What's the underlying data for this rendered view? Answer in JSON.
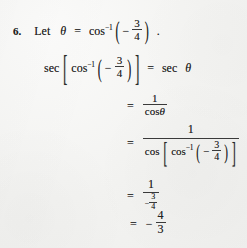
{
  "document": {
    "type": "math-solution",
    "problem_number": "6.",
    "background_color": "#f2f2f0",
    "ink_color": "#232323"
  },
  "line1": {
    "lead": "Let",
    "theta": "θ",
    "equals": "=",
    "fn": "cos",
    "exp": "−1",
    "open_paren": "(",
    "minus": "−",
    "numerator": "3",
    "denominator": "4",
    "close_paren": ")",
    "period": "."
  },
  "line2": {
    "sec": "sec",
    "open_bracket": "[",
    "fn": "cos",
    "exp": "−1",
    "open_paren": "(",
    "minus": "−",
    "numerator": "3",
    "denominator": "4",
    "close_paren": ")",
    "close_bracket": "]",
    "equals": "=",
    "rhs_fn": "sec",
    "rhs_theta": "θ"
  },
  "line3": {
    "equals": "=",
    "numerator": "1",
    "denominator_fn": "cos",
    "denominator_theta": "θ"
  },
  "line4": {
    "equals": "=",
    "numerator": "1",
    "den_fn": "cos",
    "open_bracket": "[",
    "inner_fn": "cos",
    "inner_exp": "−1",
    "open_paren": "(",
    "minus": "−",
    "inner_num": "3",
    "inner_den": "4",
    "close_paren": ")",
    "close_bracket": "]"
  },
  "line5": {
    "equals": "=",
    "numerator": "1",
    "den_minus": "−",
    "den_num": "3",
    "den_den": "4"
  },
  "line6": {
    "equals": "=",
    "minus": "−",
    "numerator": "4",
    "denominator": "3"
  }
}
